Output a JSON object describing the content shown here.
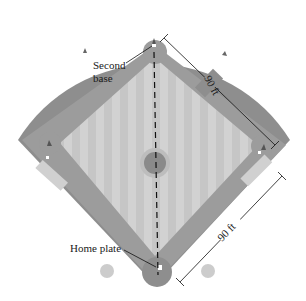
{
  "diagram": {
    "labels": {
      "second_base": [
        "Second",
        "base"
      ],
      "home_plate": "Home plate",
      "dim_top": "90 ft",
      "dim_bottom": "90 ft"
    },
    "colors": {
      "outfield": "#8c8c8c",
      "dirt": "#9a9a9a",
      "grass": "#cfcfcf",
      "grass_stripe": "#c4c4c4",
      "mound": "#8a8a8a",
      "mound_ring": "#bdbdbd",
      "coach_box": "#d0d0d0",
      "circle_marker": "#cccccc",
      "line": "#111111"
    }
  }
}
